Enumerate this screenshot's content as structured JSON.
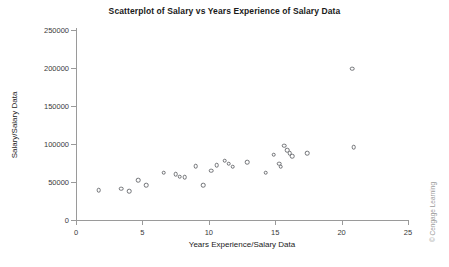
{
  "chart_data": {
    "type": "scatter",
    "title": "Scatterplot of Salary vs Years Experience of Salary Data",
    "xlabel": "Years Experience/Salary Data",
    "ylabel": "Salary/Salary Data",
    "xlim": [
      0,
      25
    ],
    "ylim": [
      0,
      250000
    ],
    "xticks": [
      0,
      5,
      10,
      15,
      20,
      25
    ],
    "xtick_labels": [
      "0",
      "5",
      "10",
      "15",
      "20",
      "25"
    ],
    "yticks": [
      0,
      50000,
      100000,
      150000,
      200000,
      250000
    ],
    "ytick_labels": [
      "0",
      "50000",
      "100000",
      "150000",
      "200000",
      "250000"
    ],
    "grid": false,
    "legend": null,
    "marker": "open-circle",
    "marker_color": "#6f7175",
    "points": [
      {
        "x": 1.7,
        "y": 39000
      },
      {
        "x": 3.4,
        "y": 41000
      },
      {
        "x": 4.0,
        "y": 38000
      },
      {
        "x": 4.7,
        "y": 52000
      },
      {
        "x": 5.3,
        "y": 46000
      },
      {
        "x": 6.6,
        "y": 62000
      },
      {
        "x": 7.5,
        "y": 60000
      },
      {
        "x": 7.8,
        "y": 57000
      },
      {
        "x": 8.2,
        "y": 56000
      },
      {
        "x": 9.0,
        "y": 71000
      },
      {
        "x": 9.6,
        "y": 46000
      },
      {
        "x": 10.2,
        "y": 65000
      },
      {
        "x": 10.6,
        "y": 72000
      },
      {
        "x": 11.2,
        "y": 78000
      },
      {
        "x": 11.5,
        "y": 74000
      },
      {
        "x": 11.8,
        "y": 70000
      },
      {
        "x": 12.9,
        "y": 76000
      },
      {
        "x": 14.3,
        "y": 62000
      },
      {
        "x": 14.9,
        "y": 86000
      },
      {
        "x": 15.3,
        "y": 74000
      },
      {
        "x": 15.4,
        "y": 70000
      },
      {
        "x": 15.7,
        "y": 98000
      },
      {
        "x": 15.9,
        "y": 92000
      },
      {
        "x": 16.1,
        "y": 88000
      },
      {
        "x": 16.3,
        "y": 84000
      },
      {
        "x": 17.4,
        "y": 88000
      },
      {
        "x": 20.8,
        "y": 199000
      },
      {
        "x": 20.9,
        "y": 96000
      }
    ]
  },
  "credit": "© Cengage Learning"
}
